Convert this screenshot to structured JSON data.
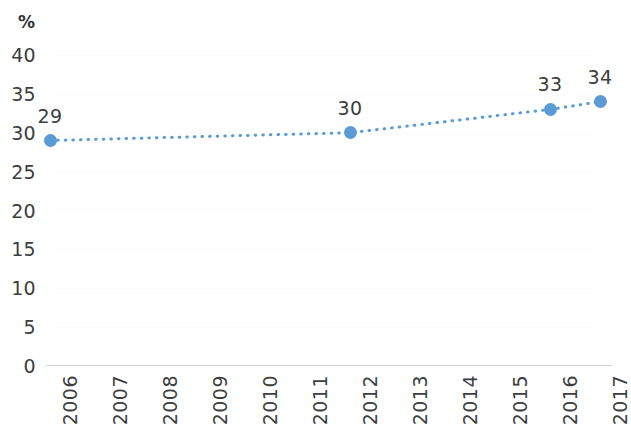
{
  "chart_data": {
    "type": "line",
    "title": "",
    "subtitle": "",
    "xlabel": "",
    "ylabel": "%",
    "ylim": [
      0,
      40
    ],
    "yticks": [
      "0",
      "5",
      "10",
      "15",
      "20",
      "25",
      "30",
      "35",
      "40"
    ],
    "ytick_values": [
      0,
      5,
      10,
      15,
      20,
      25,
      30,
      35,
      40
    ],
    "grid": false,
    "legend": "none",
    "line_style": "dotted",
    "marker": "circle",
    "categories": [
      "2006",
      "2007",
      "2008",
      "2009",
      "2010",
      "2011",
      "2012",
      "2013",
      "2014",
      "2015",
      "2016",
      "2017"
    ],
    "x": [
      2006,
      2007,
      2008,
      2009,
      2010,
      2011,
      2012,
      2013,
      2014,
      2015,
      2016,
      2017
    ],
    "series": [
      {
        "name": "",
        "values": [
          29,
          null,
          null,
          null,
          null,
          null,
          30,
          null,
          null,
          null,
          33,
          34
        ]
      }
    ],
    "points": [
      {
        "x": "2006",
        "value": 29,
        "label": "29"
      },
      {
        "x": "2012",
        "value": 30,
        "label": "30"
      },
      {
        "x": "2016",
        "value": 33,
        "label": "33"
      },
      {
        "x": "2017",
        "value": 34,
        "label": "34"
      }
    ],
    "colors": {
      "series": "#5b9bd5",
      "text": "#3c3e40",
      "axis": "#d2d4d6",
      "background": "#ffffff"
    }
  }
}
